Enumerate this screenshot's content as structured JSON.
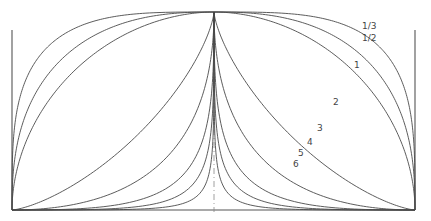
{
  "diagram": {
    "type": "family-of-curves",
    "frame": {
      "left_x": 12,
      "right_x": 415,
      "top_y": 12,
      "bottom_y": 210,
      "center_x": 214
    },
    "curves": [
      {
        "label": "1/3",
        "k": 0.28,
        "label_pos": [
          362,
          29
        ]
      },
      {
        "label": "1/2",
        "k": 0.4,
        "label_pos": [
          362,
          41
        ]
      },
      {
        "label": "1",
        "k": 0.52,
        "label_pos": [
          354,
          68
        ]
      },
      {
        "label": "2",
        "k": 1.4,
        "label_pos": [
          333,
          105
        ]
      },
      {
        "label": "3",
        "k": 2.0,
        "label_pos": [
          317,
          131
        ]
      },
      {
        "label": "4",
        "k": 2.6,
        "label_pos": [
          307,
          145
        ]
      },
      {
        "label": "5",
        "k": 3.1,
        "label_pos": [
          298,
          156
        ]
      },
      {
        "label": "6",
        "k": 3.7,
        "label_pos": [
          293,
          167
        ]
      }
    ],
    "colors": {
      "line": "#4a4a4a",
      "background": "#ffffff"
    }
  }
}
